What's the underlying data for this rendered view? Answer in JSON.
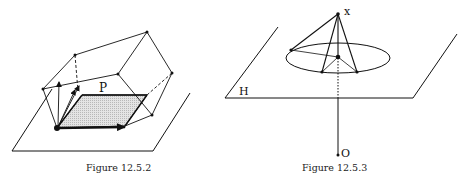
{
  "figures": [
    {
      "id": "left",
      "caption": "Figure 12.5.2",
      "labels": {
        "parallelogram": "P"
      },
      "plane": {
        "points": [
          [
            52,
            89
          ],
          [
            12,
            151
          ],
          [
            153,
            151
          ],
          [
            190,
            93
          ]
        ]
      },
      "parallelogram": {
        "points": [
          [
            57,
            128
          ],
          [
            82,
            95
          ],
          [
            147,
            95
          ],
          [
            125,
            126
          ]
        ],
        "fill": "#cfcfcf"
      },
      "origin": [
        57,
        128
      ],
      "vertices": {
        "top_left": [
          75,
          55
        ],
        "top_right": [
          147,
          32
        ],
        "middle": [
          118,
          74
        ],
        "right": [
          172,
          73
        ],
        "left": [
          43,
          89
        ],
        "lower_right": [
          152,
          115
        ]
      }
    },
    {
      "id": "right",
      "caption": "Figure 12.5.3",
      "labels": {
        "apex": "x",
        "plane": "H",
        "origin": "O"
      },
      "plane": {
        "points": [
          [
            278,
            27
          ],
          [
            225,
            98
          ],
          [
            413,
            98
          ],
          [
            457,
            34
          ]
        ]
      },
      "ellipse": {
        "cx": 338,
        "cy": 58,
        "rx": 52,
        "ry": 15
      },
      "apex": [
        338,
        14
      ],
      "center": [
        338,
        57
      ],
      "rim_points": [
        [
          291,
          50
        ],
        [
          322,
          72
        ],
        [
          357,
          72
        ]
      ],
      "origin": [
        338,
        155
      ]
    }
  ]
}
